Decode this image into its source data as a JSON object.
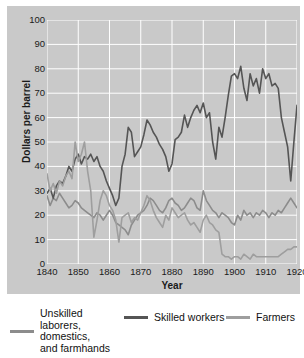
{
  "chart_data": {
    "type": "line",
    "title": "",
    "xlabel": "Year",
    "ylabel": "Dollars per barrel",
    "xlim": [
      1840,
      1920
    ],
    "ylim": [
      0,
      100
    ],
    "xticks": [
      1840,
      1850,
      1860,
      1870,
      1880,
      1890,
      1900,
      1910,
      1920
    ],
    "yticks": [
      0,
      10,
      20,
      30,
      40,
      50,
      60,
      70,
      80,
      90,
      100
    ],
    "grid": true,
    "legend_position": "bottom",
    "plot_background": "#c9c9c9",
    "gridline_color": "#ffffff",
    "series": [
      {
        "name": "Unskilled laborers, domestics, and farmhands",
        "color": "#8c8c8c",
        "x": [
          1840,
          1841,
          1842,
          1843,
          1844,
          1845,
          1846,
          1847,
          1848,
          1849,
          1850,
          1851,
          1852,
          1853,
          1854,
          1855,
          1856,
          1857,
          1858,
          1859,
          1860,
          1861,
          1862,
          1863,
          1864,
          1865,
          1866,
          1867,
          1868,
          1869,
          1870,
          1871,
          1872,
          1873,
          1874,
          1875,
          1876,
          1877,
          1878,
          1879,
          1880,
          1881,
          1882,
          1883,
          1884,
          1885,
          1886,
          1887,
          1888,
          1889,
          1890,
          1891,
          1892,
          1893,
          1894,
          1895,
          1896,
          1897,
          1898,
          1899,
          1900,
          1901,
          1902,
          1903,
          1904,
          1905,
          1906,
          1907,
          1908,
          1909,
          1910,
          1911,
          1912,
          1913,
          1914,
          1915,
          1916,
          1917,
          1918,
          1919,
          1920
        ],
        "values": [
          28,
          24,
          27,
          26,
          29,
          27,
          25,
          23,
          24,
          26,
          25,
          23,
          22,
          21,
          20,
          19,
          21,
          20,
          18,
          20,
          22,
          20,
          17,
          16,
          15,
          14,
          12,
          16,
          18,
          20,
          21,
          22,
          24,
          27,
          26,
          24,
          22,
          21,
          23,
          26,
          27,
          25,
          24,
          22,
          23,
          25,
          27,
          26,
          23,
          22,
          30,
          26,
          24,
          22,
          21,
          19,
          21,
          20,
          19,
          17,
          16,
          20,
          18,
          22,
          20,
          21,
          19,
          21,
          20,
          22,
          21,
          19,
          21,
          20,
          22,
          21,
          23,
          25,
          27,
          25,
          23
        ]
      },
      {
        "name": "Skilled workers",
        "color": "#555555",
        "x": [
          1840,
          1841,
          1842,
          1843,
          1844,
          1845,
          1846,
          1847,
          1848,
          1849,
          1850,
          1851,
          1852,
          1853,
          1854,
          1855,
          1856,
          1857,
          1858,
          1859,
          1860,
          1861,
          1862,
          1863,
          1864,
          1865,
          1866,
          1867,
          1868,
          1869,
          1870,
          1871,
          1872,
          1873,
          1874,
          1875,
          1876,
          1877,
          1878,
          1879,
          1880,
          1881,
          1882,
          1883,
          1884,
          1885,
          1886,
          1887,
          1888,
          1889,
          1890,
          1891,
          1892,
          1893,
          1894,
          1895,
          1896,
          1897,
          1898,
          1899,
          1900,
          1901,
          1902,
          1903,
          1904,
          1905,
          1906,
          1907,
          1908,
          1909,
          1910,
          1911,
          1912,
          1913,
          1914,
          1915,
          1916,
          1917,
          1918,
          1919,
          1920
        ],
        "values": [
          29,
          31,
          27,
          32,
          34,
          33,
          36,
          40,
          38,
          43,
          45,
          41,
          44,
          43,
          45,
          42,
          44,
          40,
          38,
          34,
          31,
          28,
          24,
          27,
          40,
          45,
          56,
          54,
          44,
          46,
          48,
          53,
          59,
          57,
          54,
          52,
          49,
          47,
          44,
          38,
          41,
          51,
          52,
          54,
          61,
          56,
          60,
          63,
          65,
          62,
          66,
          60,
          62,
          50,
          43,
          56,
          52,
          60,
          69,
          77,
          78,
          76,
          81,
          72,
          67,
          78,
          73,
          76,
          70,
          80,
          76,
          78,
          73,
          74,
          72,
          60,
          54,
          48,
          34,
          50,
          65
        ]
      },
      {
        "name": "Farmers",
        "color": "#9e9e9e",
        "x": [
          1840,
          1841,
          1842,
          1843,
          1844,
          1845,
          1846,
          1847,
          1848,
          1849,
          1850,
          1851,
          1852,
          1853,
          1854,
          1855,
          1856,
          1857,
          1858,
          1859,
          1860,
          1861,
          1862,
          1863,
          1864,
          1865,
          1866,
          1867,
          1868,
          1869,
          1870,
          1871,
          1872,
          1873,
          1874,
          1875,
          1876,
          1877,
          1878,
          1879,
          1880,
          1881,
          1882,
          1883,
          1884,
          1885,
          1886,
          1887,
          1888,
          1889,
          1890,
          1891,
          1892,
          1893,
          1894,
          1895,
          1896,
          1897,
          1898,
          1899,
          1900,
          1901,
          1902,
          1903,
          1904,
          1905,
          1906,
          1907,
          1908,
          1909,
          1910,
          1911,
          1912,
          1913,
          1914,
          1915,
          1916,
          1917,
          1918,
          1919,
          1920
        ],
        "values": [
          37,
          30,
          33,
          29,
          34,
          32,
          36,
          38,
          35,
          50,
          42,
          45,
          50,
          38,
          30,
          11,
          18,
          26,
          30,
          28,
          24,
          22,
          18,
          9,
          19,
          20,
          21,
          17,
          19,
          18,
          21,
          24,
          28,
          26,
          22,
          19,
          17,
          15,
          20,
          18,
          23,
          21,
          19,
          20,
          21,
          18,
          16,
          17,
          15,
          13,
          18,
          20,
          17,
          16,
          14,
          13,
          4,
          3,
          3,
          2,
          3,
          3,
          2,
          4,
          3,
          2,
          4,
          3,
          3,
          3,
          3,
          3,
          3,
          3,
          3,
          4,
          5,
          6,
          6,
          7,
          7
        ]
      }
    ]
  },
  "legend": {
    "items": [
      {
        "label_lines": [
          "Unskilled",
          "laborers,",
          "domestics,",
          "and farmhands"
        ],
        "color": "#8c8c8c"
      },
      {
        "label_lines": [
          "Skilled workers"
        ],
        "color": "#555555"
      },
      {
        "label_lines": [
          "Farmers"
        ],
        "color": "#9e9e9e"
      }
    ]
  }
}
